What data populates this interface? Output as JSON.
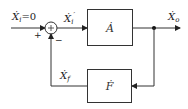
{
  "diagram": {
    "type": "feedback-block-diagram",
    "input": {
      "symbol": "Ẋ",
      "subscript": "i",
      "suffix": "=0"
    },
    "error": {
      "symbol": "Ẋ",
      "subscript": "i",
      "prime": "′"
    },
    "output": {
      "symbol": "Ẋ",
      "subscript": "o"
    },
    "feedback_signal": {
      "symbol": "Ẋ",
      "subscript": "f"
    },
    "forward_block": {
      "label": "Ȧ"
    },
    "feedback_block": {
      "label": "Ḟ"
    },
    "summing_junction": {
      "plus": "+",
      "minus": "−"
    },
    "colors": {
      "line": "#333333",
      "background": "#ffffff"
    }
  }
}
